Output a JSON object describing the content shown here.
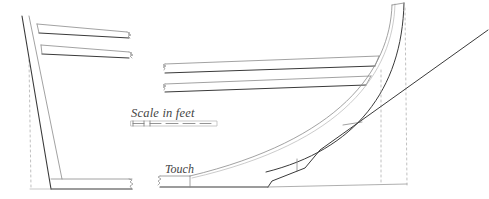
{
  "diagram": {
    "type": "hull-framing-section",
    "labels": {
      "scale": "Scale in feet",
      "touch": "Touch"
    },
    "scale_bar": {
      "segments": 5
    },
    "colors": {
      "line_dark": "#3a3a3a",
      "line_light": "#8a8a8a",
      "dashed": "#b0b0b0",
      "background": "#ffffff"
    },
    "components": [
      "left-stern-post",
      "left-upper-plank",
      "left-middle-plank",
      "left-heel-plank",
      "curved-rib",
      "right-upper-plank",
      "right-lower-plank",
      "keel-bottom-line",
      "diagonal-rise-line"
    ]
  }
}
